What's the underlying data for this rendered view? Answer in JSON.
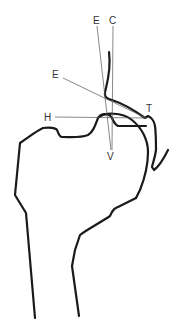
{
  "diagram": {
    "type": "hip joint radiographic line drawing (proximal femur and acetabulum)",
    "labels": {
      "E_top": "E",
      "C_top": "C",
      "E_left": "E",
      "H": "H",
      "T": "T",
      "V": "V"
    },
    "colors": {
      "bone_outline": "#1a1a1a",
      "reference_lines": "#555555",
      "background": "#ffffff"
    }
  }
}
